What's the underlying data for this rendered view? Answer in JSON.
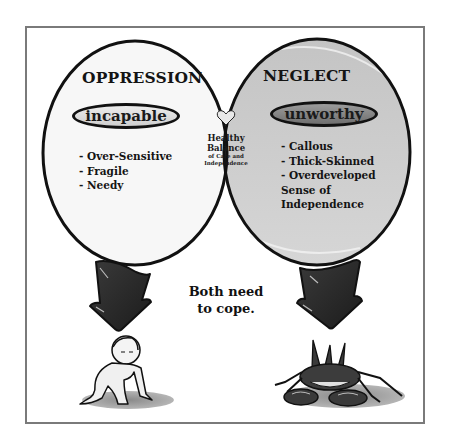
{
  "diagram": {
    "type": "venn",
    "left_set": {
      "title": "OPPRESSION",
      "label": "incapable",
      "traits": [
        "- Over-Sensitive",
        "- Fragile",
        "- Needy"
      ],
      "fill_color": "#f7f7f7"
    },
    "right_set": {
      "title": "NEGLECT",
      "label": "unworthy",
      "traits": [
        "- Callous",
        "- Thick-Skinned",
        "- Overdeveloped",
        "Sense of",
        "Independence"
      ],
      "fill_color": "#cdcdcd"
    },
    "intersection": {
      "icon": "heart-icon",
      "line1": "Healthy",
      "line2": "Balance",
      "line3": "of Care and",
      "line4": "Independence",
      "fill_color": "#545454"
    },
    "caption_line1": "Both need",
    "caption_line2": "to cope.",
    "left_outcome": "crawling-baby-illustration",
    "right_outcome": "spiky-crab-illustration",
    "colors": {
      "frame": "#7a7a7a",
      "outline": "#111111",
      "arrow": "#2a2a2a"
    }
  }
}
